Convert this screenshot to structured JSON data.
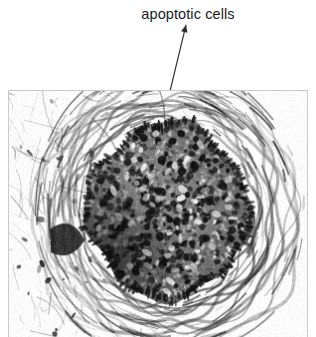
{
  "figure": {
    "width": 316,
    "height": 337,
    "background_color": "#ffffff",
    "type": "annotated-micrograph"
  },
  "annotation": {
    "label": "apoptotic cells",
    "text_color": "#1a1a1a",
    "arrow": {
      "name": "leader-arrow",
      "color": "#2b2b2b",
      "stroke_width": 1.1,
      "head_x": 186,
      "head_y": 25,
      "tail_x": 156,
      "tail_y": 149
    }
  },
  "micrograph": {
    "panel": {
      "x": 8,
      "y": 90,
      "width": 300,
      "height": 247,
      "border_color": "#c9c9c9",
      "background_color": "#fdfdfd"
    },
    "description": "Grayscale histological section showing a rounded structure with concentric lamellar layers surrounding a dense cellular core containing darkly stained nuclei",
    "modality": "light-microscopy",
    "stain_tone": "grayscale",
    "structure": {
      "core": {
        "center_x": 168,
        "center_y": 210,
        "radius_x": 82,
        "radius_y": 88,
        "fill_tone": "#7c7c7c",
        "nuclei_count": 420,
        "nuclei_tone": "#1d1d1d"
      },
      "lamellae": {
        "ring_count": 11,
        "tone_dark": "#2a2a2a",
        "tone_light": "#f2f2f2"
      },
      "left_field": {
        "description": "pale loose connective tissue with sparse dark fibers",
        "tone": "#fbfbfb"
      }
    }
  }
}
